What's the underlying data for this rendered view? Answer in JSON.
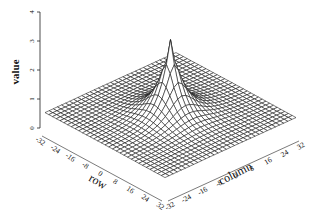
{
  "chart_data": {
    "type": "surface3d",
    "title": "",
    "zlabel": "value",
    "xlabel": "row",
    "ylabel": "column",
    "z_ticks": [
      0,
      1,
      2,
      3,
      4
    ],
    "zlim": [
      0,
      4
    ],
    "row_ticks": [
      -32,
      -24,
      -16,
      -8,
      0,
      8,
      16,
      24,
      32
    ],
    "column_ticks": [
      -32,
      -24,
      -16,
      -8,
      0,
      8,
      16,
      24,
      32
    ],
    "row_range": [
      -32,
      32
    ],
    "column_range": [
      -32,
      32
    ],
    "grid_step": 2,
    "peak": {
      "row": 0,
      "column": 0,
      "value": 3.2
    },
    "baseline_value": 0.6,
    "colors": {
      "mesh": "#111111",
      "background": "#ffffff",
      "axis": "#222222"
    }
  }
}
